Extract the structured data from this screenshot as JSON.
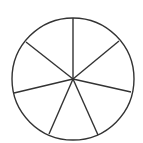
{
  "diagram": {
    "type": "divided-circle",
    "sector_count": 7,
    "stroke_color": "#333333",
    "background_color": "#ffffff",
    "circle": {
      "cx": 73,
      "cy": 79,
      "r": 61
    },
    "spokes": [
      {
        "x": 73,
        "y": 18
      },
      {
        "x": 119,
        "y": 41
      },
      {
        "x": 131,
        "y": 92
      },
      {
        "x": 98,
        "y": 135
      },
      {
        "x": 49,
        "y": 134
      },
      {
        "x": 14,
        "y": 93
      },
      {
        "x": 26,
        "y": 42
      }
    ]
  }
}
